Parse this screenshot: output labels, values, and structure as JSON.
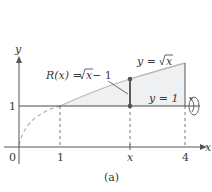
{
  "figure": {
    "caption": "(a)",
    "axes": {
      "x_label": "x",
      "y_label": "y",
      "x_ticks": [
        "0",
        "1",
        "x",
        "4"
      ],
      "y_ticks": [
        "1"
      ]
    },
    "curves": {
      "upper": {
        "label": "y = √x",
        "lhs": "y = ",
        "rad": "x"
      },
      "lower": {
        "label": "y = 1"
      }
    },
    "radius_label": {
      "text": "R(x) = √x − 1",
      "lhs": "R(x) = ",
      "rad": "x",
      "tail": " − 1"
    },
    "rotation_axis_icon": "rotation-arrow-icon",
    "colors": {
      "axis": "#555555",
      "curve": "#b8b8b8",
      "region_fill": "#eef0f2",
      "line": "#4a4a4a",
      "point": "#555555"
    }
  }
}
